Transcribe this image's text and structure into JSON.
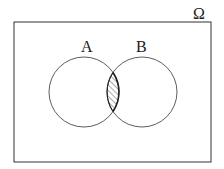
{
  "diagram": {
    "type": "venn",
    "universe_label": "Ω",
    "sets": [
      {
        "label": "A",
        "cx": 84,
        "cy": 92,
        "r": 35
      },
      {
        "label": "B",
        "cx": 142,
        "cy": 92,
        "r": 35
      }
    ],
    "shaded_region": "A ∩ B",
    "universe_rect": {
      "x": 14,
      "y": 22,
      "width": 197,
      "height": 140
    },
    "colors": {
      "stroke": "#333333",
      "hatch": "#444444",
      "background": "#ffffff"
    }
  }
}
